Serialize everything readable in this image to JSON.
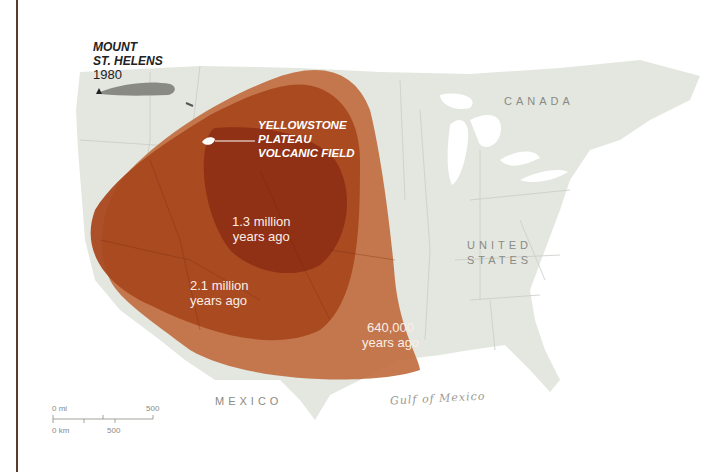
{
  "map": {
    "title_region": "Yellowstone ash fall extents",
    "labels": {
      "mount_st_helens": {
        "line1": "MOUNT",
        "line2": "ST. HELENS",
        "year": "1980"
      },
      "yellowstone": {
        "line1": "YELLOWSTONE",
        "line2": "PLATEAU",
        "line3": "VOLCANIC FIELD"
      },
      "canada": "CANADA",
      "united_states": {
        "line1": "UNITED",
        "line2": "STATES"
      },
      "mexico": "MEXICO",
      "gulf": "Gulf of Mexico"
    },
    "eruptions": [
      {
        "line1": "1.3 million",
        "line2": "years ago",
        "color": "#8e2e14"
      },
      {
        "line1": "2.1 million",
        "line2": "years ago",
        "color": "#a9481f"
      },
      {
        "line1": "640,000",
        "line2": "years ago",
        "color": "#c06a3c"
      }
    ],
    "scale": {
      "mi_start": "0 mi",
      "mi_end": "500",
      "km_start": "0 km",
      "km_mid": "500"
    },
    "colors": {
      "land": "#e4e7e0",
      "border": "#c9cdc4",
      "water": "#ffffff",
      "frame": "#5a3a2a",
      "ash_1980": "#8a8a84"
    }
  }
}
